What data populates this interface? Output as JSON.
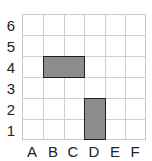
{
  "grid": {
    "columns": [
      "A",
      "B",
      "C",
      "D",
      "E",
      "F"
    ],
    "rows": [
      "6",
      "5",
      "4",
      "3",
      "2",
      "1"
    ],
    "shaded_regions": [
      {
        "name": "horizontal-rectangle",
        "cells": [
          "B4",
          "C4"
        ],
        "color": "#8c8c8c"
      },
      {
        "name": "vertical-rectangle",
        "cells": [
          "D1",
          "D2"
        ],
        "color": "#8c8c8c"
      }
    ]
  }
}
